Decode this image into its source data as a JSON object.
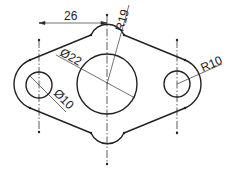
{
  "drawing": {
    "type": "mechanical-part-outline",
    "colors": {
      "line": "#222222",
      "background": "#ffffff"
    },
    "dimensions": {
      "center_distance": "26",
      "outer_center_radius": "R19",
      "center_hole_diameter": "Ø22",
      "side_hole_diameter": "Ø10",
      "side_outer_radius": "R10"
    }
  }
}
